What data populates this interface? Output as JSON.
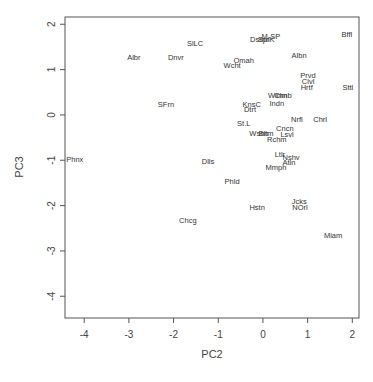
{
  "chart_data": {
    "type": "scatter",
    "title": "",
    "xlabel": "PC2",
    "ylabel": "PC3",
    "xlim": [
      -4.43,
      2.15
    ],
    "ylim": [
      -4.48,
      2.16
    ],
    "xticks": [
      -4,
      -3,
      -2,
      -1,
      0,
      1,
      2
    ],
    "yticks": [
      -4,
      -3,
      -2,
      -1,
      0,
      1,
      2
    ],
    "grid": false,
    "legend": null,
    "marker": "text-labels",
    "points": [
      {
        "label": "Bffl",
        "x": 1.88,
        "y": 1.77
      },
      {
        "label": "M-SP",
        "x": 0.18,
        "y": 1.74
      },
      {
        "label": "Dsmn",
        "x": -0.07,
        "y": 1.66
      },
      {
        "label": "SprK",
        "x": 0.07,
        "y": 1.66
      },
      {
        "label": "SlLC",
        "x": -1.52,
        "y": 1.57
      },
      {
        "label": "Albr",
        "x": -2.89,
        "y": 1.26
      },
      {
        "label": "Dnvr",
        "x": -1.95,
        "y": 1.26
      },
      {
        "label": "Albn",
        "x": 0.81,
        "y": 1.32
      },
      {
        "label": "Omah",
        "x": -0.43,
        "y": 1.21
      },
      {
        "label": "Wcht",
        "x": -0.69,
        "y": 1.1
      },
      {
        "label": "Prvd",
        "x": 1.01,
        "y": 0.88
      },
      {
        "label": "Clvl",
        "x": 1.01,
        "y": 0.73
      },
      {
        "label": "Hrtf",
        "x": 0.98,
        "y": 0.6
      },
      {
        "label": "Sttl",
        "x": 1.9,
        "y": 0.6
      },
      {
        "label": "Wlmn",
        "x": 0.33,
        "y": 0.42
      },
      {
        "label": "Clmb",
        "x": 0.45,
        "y": 0.42
      },
      {
        "label": "Indn",
        "x": 0.31,
        "y": 0.26
      },
      {
        "label": "KnsC",
        "x": -0.25,
        "y": 0.24
      },
      {
        "label": "Dtrt",
        "x": -0.29,
        "y": 0.11
      },
      {
        "label": "SFrn",
        "x": -2.17,
        "y": 0.22
      },
      {
        "label": "Nrfl",
        "x": 0.76,
        "y": -0.11
      },
      {
        "label": "Chrl",
        "x": 1.28,
        "y": -0.11
      },
      {
        "label": "St.L",
        "x": -0.43,
        "y": -0.2
      },
      {
        "label": "Cncn",
        "x": 0.49,
        "y": -0.31
      },
      {
        "label": "Lsvl",
        "x": 0.54,
        "y": -0.44
      },
      {
        "label": "Wshn",
        "x": -0.09,
        "y": -0.4
      },
      {
        "label": "Bltm",
        "x": 0.07,
        "y": -0.4
      },
      {
        "label": "Rchm",
        "x": 0.31,
        "y": -0.55
      },
      {
        "label": "Ltlr",
        "x": 0.38,
        "y": -0.88
      },
      {
        "label": "Nshv",
        "x": 0.63,
        "y": -0.93
      },
      {
        "label": "Atln",
        "x": 0.58,
        "y": -1.04
      },
      {
        "label": "Mmph",
        "x": 0.29,
        "y": -1.17
      },
      {
        "label": "Phnx",
        "x": -4.21,
        "y": -0.99
      },
      {
        "label": "Dlls",
        "x": -1.23,
        "y": -1.02
      },
      {
        "label": "Phld",
        "x": -0.69,
        "y": -1.46
      },
      {
        "label": "Hstn",
        "x": -0.13,
        "y": -2.05
      },
      {
        "label": "Jcks",
        "x": 0.81,
        "y": -1.92
      },
      {
        "label": "NOrl",
        "x": 0.83,
        "y": -2.05
      },
      {
        "label": "Chcg",
        "x": -1.68,
        "y": -2.32
      },
      {
        "label": "Miam",
        "x": 1.57,
        "y": -2.67
      }
    ]
  },
  "colors": {
    "background": "#ffffff",
    "axis": "#555555",
    "text": "#333333"
  }
}
